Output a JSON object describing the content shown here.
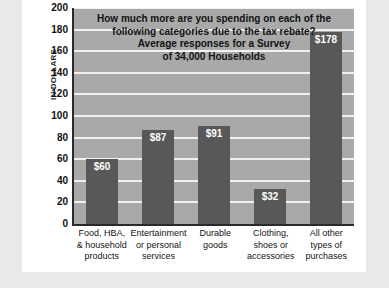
{
  "chart_data": {
    "type": "bar",
    "title_lines": [
      "How much more are you spending on each of the",
      "following categories due to the tax rebate?",
      "Average responses for a Survey",
      "of 34,000 Households"
    ],
    "categories": [
      "Food, HBA, & household products",
      "Entertainment or personal services",
      "Durable goods",
      "Clothing, shoes or accessories",
      "All other types of purchases"
    ],
    "category_lines": [
      [
        "Food, HBA,",
        "& household",
        "products"
      ],
      [
        "Entertainment",
        "or personal",
        "services"
      ],
      [
        "Durable",
        "goods"
      ],
      [
        "Clothing,",
        "shoes or",
        "accessories"
      ],
      [
        "All other",
        "types of",
        "purchases"
      ]
    ],
    "values": [
      60,
      87,
      91,
      32,
      178
    ],
    "value_labels": [
      "$60",
      "$87",
      "$91",
      "$32",
      "$178"
    ],
    "xlabel": "",
    "ylabel": "IN DOLLARS",
    "ylim": [
      0,
      200
    ],
    "ytick_step": 20,
    "yticks": [
      200,
      180,
      160,
      140,
      120,
      100,
      80,
      60,
      40,
      20,
      0
    ],
    "grid": true,
    "legend": "none",
    "colors": {
      "bar": "#585858",
      "plot_background": "#a9a9a9",
      "gridline": "#f2f2f2",
      "axis": "#2a2a2a",
      "card_background": "#ffffff",
      "page_background": "#e9e9e9",
      "value_label_text": "#ffffff",
      "title_text": "#111111",
      "tick_text": "#101010"
    }
  },
  "footer": {
    "source_note": ""
  }
}
